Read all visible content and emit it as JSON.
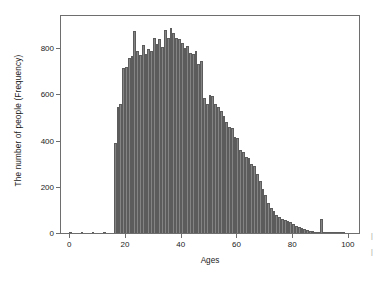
{
  "chart_data": {
    "type": "bar",
    "title": "",
    "subtitle": "",
    "xlabel": "Ages",
    "ylabel": "The number of people (Frequency)",
    "xlim": [
      -3,
      104
    ],
    "ylim": [
      0,
      940
    ],
    "xticks": [
      0,
      20,
      40,
      60,
      80,
      100
    ],
    "yticks": [
      0,
      200,
      400,
      600,
      800
    ],
    "xtick_labels": [
      "0",
      "20",
      "40",
      "60",
      "80",
      "100"
    ],
    "ytick_labels": [
      "0",
      "200",
      "400",
      "600",
      "800"
    ],
    "grid": false,
    "legend": null,
    "bar_color": "#848484",
    "bar_edge_color": "#5c5c5c",
    "axis_color": "#6e6e6e",
    "bin_width": 1,
    "categories": [
      0,
      1,
      2,
      3,
      4,
      5,
      6,
      7,
      8,
      9,
      10,
      11,
      12,
      13,
      14,
      15,
      16,
      17,
      18,
      19,
      20,
      21,
      22,
      23,
      24,
      25,
      26,
      27,
      28,
      29,
      30,
      31,
      32,
      33,
      34,
      35,
      36,
      37,
      38,
      39,
      40,
      41,
      42,
      43,
      44,
      45,
      46,
      47,
      48,
      49,
      50,
      51,
      52,
      53,
      54,
      55,
      56,
      57,
      58,
      59,
      60,
      61,
      62,
      63,
      64,
      65,
      66,
      67,
      68,
      69,
      70,
      71,
      72,
      73,
      74,
      75,
      76,
      77,
      78,
      79,
      80,
      81,
      82,
      83,
      84,
      85,
      86,
      87,
      88,
      89,
      90,
      91,
      92,
      93,
      94,
      95,
      96,
      97,
      98,
      99,
      100
    ],
    "values": [
      4,
      0,
      0,
      0,
      3,
      0,
      0,
      0,
      3,
      0,
      0,
      0,
      4,
      0,
      0,
      0,
      390,
      545,
      560,
      715,
      720,
      760,
      765,
      875,
      790,
      770,
      815,
      775,
      795,
      790,
      845,
      820,
      840,
      805,
      880,
      845,
      890,
      865,
      845,
      840,
      825,
      800,
      810,
      780,
      775,
      790,
      730,
      745,
      585,
      560,
      600,
      595,
      560,
      545,
      530,
      505,
      480,
      460,
      455,
      415,
      410,
      360,
      350,
      330,
      325,
      300,
      290,
      255,
      225,
      190,
      165,
      130,
      110,
      95,
      80,
      70,
      62,
      56,
      50,
      46,
      40,
      32,
      27,
      22,
      18,
      14,
      10,
      8,
      6,
      5,
      60,
      3,
      2,
      2,
      1,
      1,
      4,
      3,
      2,
      0,
      0
    ]
  },
  "axis_labels": {
    "x": "Ages",
    "y": "The number of people (Frequency)"
  },
  "page_margin_marks": {
    "right_top": "|",
    "right_bottom": "|"
  }
}
